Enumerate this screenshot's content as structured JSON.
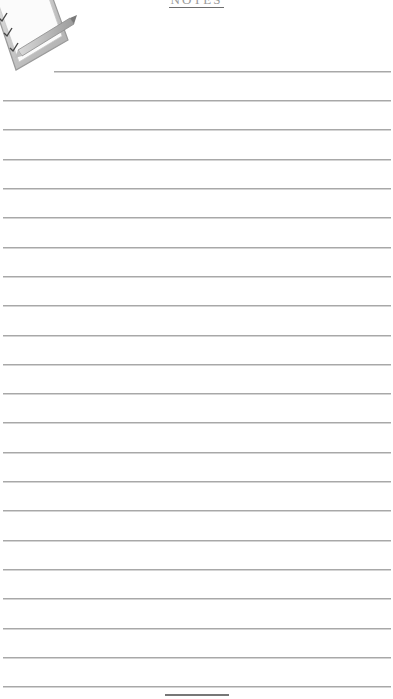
{
  "document": {
    "type": "lined-notes-page",
    "title": "NOTES",
    "icon": "clipboard-checklist-pencil-icon",
    "line_color": "#a8a8a8",
    "footer_line_color": "#777777"
  },
  "lines": [
    {
      "y": 71,
      "x": 54
    },
    {
      "y": 100,
      "x": 3
    },
    {
      "y": 129,
      "x": 3
    },
    {
      "y": 159,
      "x": 3
    },
    {
      "y": 188,
      "x": 3
    },
    {
      "y": 217,
      "x": 3
    },
    {
      "y": 247,
      "x": 3
    },
    {
      "y": 276,
      "x": 3
    },
    {
      "y": 305,
      "x": 3
    },
    {
      "y": 335,
      "x": 3
    },
    {
      "y": 364,
      "x": 3
    },
    {
      "y": 393,
      "x": 3
    },
    {
      "y": 422,
      "x": 3
    },
    {
      "y": 452,
      "x": 3
    },
    {
      "y": 481,
      "x": 3
    },
    {
      "y": 510,
      "x": 3
    },
    {
      "y": 540,
      "x": 3
    },
    {
      "y": 569,
      "x": 3
    },
    {
      "y": 598,
      "x": 3
    },
    {
      "y": 628,
      "x": 3
    },
    {
      "y": 657,
      "x": 3
    },
    {
      "y": 686,
      "x": 3
    }
  ]
}
